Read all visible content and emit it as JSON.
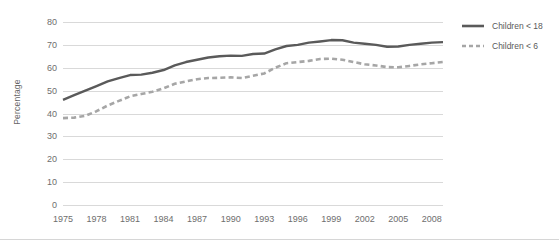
{
  "chart_data": {
    "type": "line",
    "title": "",
    "xlabel": "",
    "ylabel": "Percentage",
    "ylim": [
      0,
      80
    ],
    "ytick_step": 10,
    "yticks": [
      "0",
      "10",
      "20",
      "30",
      "40",
      "50",
      "60",
      "70",
      "80"
    ],
    "grid": true,
    "legend_position": "right",
    "xlim": [
      1975,
      2009
    ],
    "xticks": [
      "1975",
      "1978",
      "1981",
      "1984",
      "1987",
      "1990",
      "1993",
      "1996",
      "1999",
      "2002",
      "2005",
      "2008"
    ],
    "x": [
      1975,
      1976,
      1977,
      1978,
      1979,
      1980,
      1981,
      1982,
      1983,
      1984,
      1985,
      1986,
      1987,
      1988,
      1989,
      1990,
      1991,
      1992,
      1993,
      1994,
      1995,
      1996,
      1997,
      1998,
      1999,
      2000,
      2001,
      2002,
      2003,
      2004,
      2005,
      2006,
      2007,
      2008,
      2009
    ],
    "series": [
      {
        "name": "Children < 18",
        "style": "solid",
        "color": "#5a5a5a",
        "values": [
          46.0,
          48.0,
          50.0,
          52.0,
          54.0,
          55.5,
          56.8,
          57.0,
          57.8,
          59.0,
          61.0,
          62.5,
          63.5,
          64.5,
          65.0,
          65.3,
          65.2,
          66.0,
          66.2,
          68.0,
          69.5,
          70.0,
          71.0,
          71.5,
          72.1,
          72.0,
          71.0,
          70.5,
          70.0,
          69.2,
          69.3,
          70.0,
          70.5,
          71.0,
          71.2
        ]
      },
      {
        "name": "Children < 6",
        "style": "dashed",
        "color": "#a6a6a6",
        "values": [
          38.0,
          38.2,
          39.0,
          41.0,
          43.5,
          45.5,
          47.5,
          48.5,
          49.5,
          51.0,
          53.0,
          54.0,
          55.0,
          55.5,
          55.6,
          55.8,
          55.5,
          56.5,
          57.5,
          60.0,
          62.0,
          62.5,
          63.0,
          63.8,
          64.0,
          63.5,
          62.5,
          61.5,
          61.0,
          60.3,
          60.2,
          60.8,
          61.5,
          62.0,
          62.5
        ]
      }
    ]
  },
  "legend": {
    "items": [
      {
        "label": "Children < 18"
      },
      {
        "label": "Children < 6"
      }
    ]
  }
}
